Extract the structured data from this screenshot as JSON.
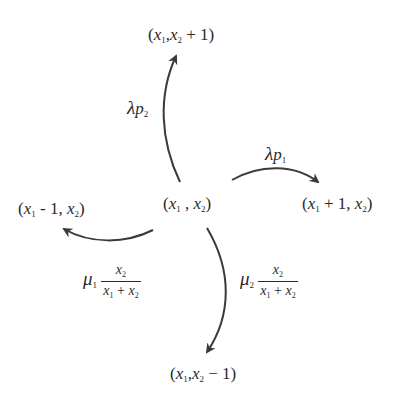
{
  "diagram": {
    "type": "state-transition",
    "center_state": {
      "x1": "x",
      "sub1": "1",
      "x2": "x",
      "sub2": "2",
      "text": "(x1 , x2)"
    },
    "states": {
      "up": {
        "text": "(x1,x2 + 1)",
        "tail": " + 1)"
      },
      "right": {
        "text": "(x1 + 1, x2)",
        "mid": " + 1, "
      },
      "left": {
        "text": "(x1 - 1, x2)",
        "mid": " - 1, "
      },
      "down": {
        "text": "(x1,x2 - 1)",
        "tail": " − 1)"
      }
    },
    "transitions": [
      {
        "direction": "up",
        "rate": "λp2",
        "greek": "λ",
        "var": "p",
        "sub": "2"
      },
      {
        "direction": "right",
        "rate": "λp1",
        "greek": "λ",
        "var": "p",
        "sub": "1"
      },
      {
        "direction": "left",
        "rate": "μ1 x2/(x1+x2)",
        "greek": "μ",
        "sub": "1",
        "num": "x2",
        "den": "x1 + x2"
      },
      {
        "direction": "down",
        "rate": "μ2 x2/(x1+x2)",
        "greek": "μ",
        "sub": "2",
        "num": "x2",
        "den": "x1 + x2"
      }
    ],
    "colors": {
      "stroke": "#3a3a3a",
      "text": "#2a2a2a",
      "background": "#ffffff"
    }
  }
}
